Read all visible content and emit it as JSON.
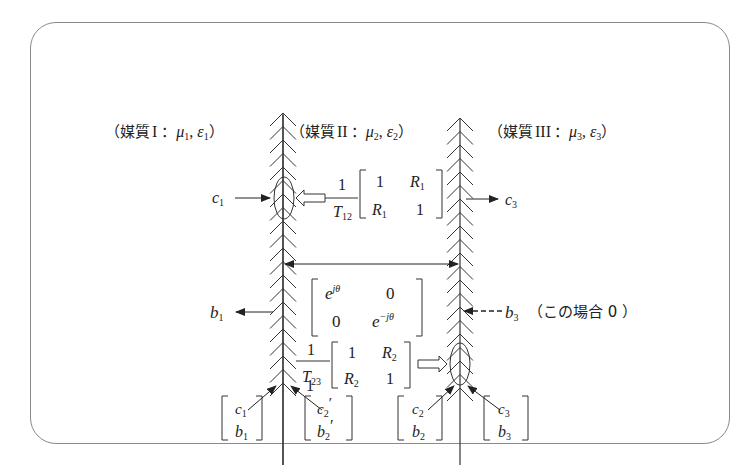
{
  "media": [
    {
      "label_prefix": "（媒質",
      "roman": "I",
      "sep": "：",
      "mu": "μ",
      "mu_sub": "1",
      "eps": "ε",
      "eps_sub": "1",
      "close": "）"
    },
    {
      "label_prefix": "（媒質",
      "roman": "II",
      "sep": "：",
      "mu": "μ",
      "mu_sub": "2",
      "eps": "ε",
      "eps_sub": "2",
      "close": "）"
    },
    {
      "label_prefix": "（媒質",
      "roman": "III",
      "sep": "：",
      "mu": "μ",
      "mu_sub": "3",
      "eps": "ε",
      "eps_sub": "3",
      "close": "）"
    }
  ],
  "signals": {
    "c1": {
      "base": "c",
      "sub": "1"
    },
    "c3": {
      "base": "c",
      "sub": "3"
    },
    "b1": {
      "base": "b",
      "sub": "1"
    },
    "b3": {
      "base": "b",
      "sub": "3"
    },
    "b3_note": "（この場合 0 ）"
  },
  "matrix_T12": {
    "numerator": "1",
    "denominator_base": "T",
    "denominator_sub": "12",
    "cells": [
      [
        "1",
        "R",
        "1"
      ],
      [
        "R",
        "1",
        "1"
      ]
    ],
    "a11": "1",
    "a12_base": "R",
    "a12_sub": "1",
    "a21_base": "R",
    "a21_sub": "1",
    "a22": "1"
  },
  "matrix_phase": {
    "a11_base": "e",
    "a11_sup": "jθ",
    "a12": "0",
    "a21": "0",
    "a22_base": "e",
    "a22_sup": "−jθ"
  },
  "matrix_T23": {
    "numerator": "1",
    "denominator_base": "T",
    "denominator_sub": "23",
    "a11": "1",
    "a12_base": "R",
    "a12_sub": "2",
    "a21_base": "R",
    "a21_sub": "2",
    "a22": "1"
  },
  "vectors": [
    {
      "top_base": "c",
      "top_sub": "1",
      "top_prime": "",
      "bot_base": "b",
      "bot_sub": "1",
      "bot_prime": ""
    },
    {
      "top_base": "c",
      "top_sub": "2",
      "top_prime": "′",
      "bot_base": "b",
      "bot_sub": "2",
      "bot_prime": "′"
    },
    {
      "top_base": "c",
      "top_sub": "2",
      "top_prime": "",
      "bot_base": "b",
      "bot_sub": "2",
      "bot_prime": ""
    },
    {
      "top_base": "c",
      "top_sub": "3",
      "top_prime": "",
      "bot_base": "b",
      "bot_sub": "3",
      "bot_prime": ""
    }
  ],
  "colors": {
    "line": "#333333",
    "frame": "#8a8a8a",
    "text": "#222222"
  }
}
